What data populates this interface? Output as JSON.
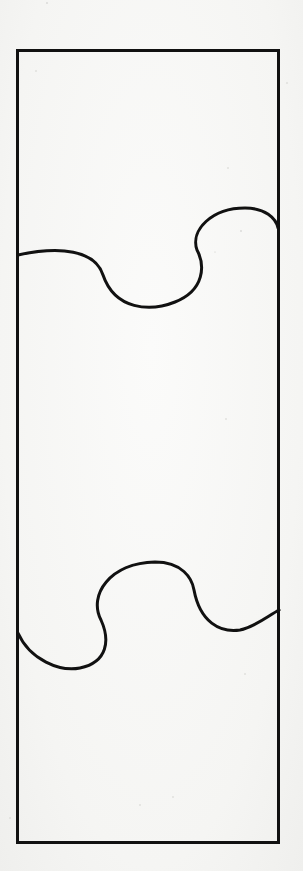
{
  "diagram": {
    "colors": {
      "background": "#f7f7f5",
      "stroke": "#111111"
    },
    "stroke_width": 3,
    "frame": {
      "x": 17,
      "y": 50,
      "width": 262,
      "height": 793
    },
    "curves": [
      {
        "name": "upper-wave",
        "path": "M18,255 C60,246 95,250 103,275 C115,310 150,312 175,302 C205,290 205,265 197,250 C190,230 212,208 245,208 C265,208 276,218 278,228"
      },
      {
        "name": "lower-wave",
        "path": "M18,633 C30,660 60,672 80,668 C108,662 110,640 101,620 C88,595 110,563 155,562 C182,562 192,578 194,590 C200,622 220,633 240,630 C255,627 268,616 279,610"
      }
    ],
    "pieces": [
      "top-piece",
      "middle-piece",
      "bottom-piece"
    ]
  }
}
